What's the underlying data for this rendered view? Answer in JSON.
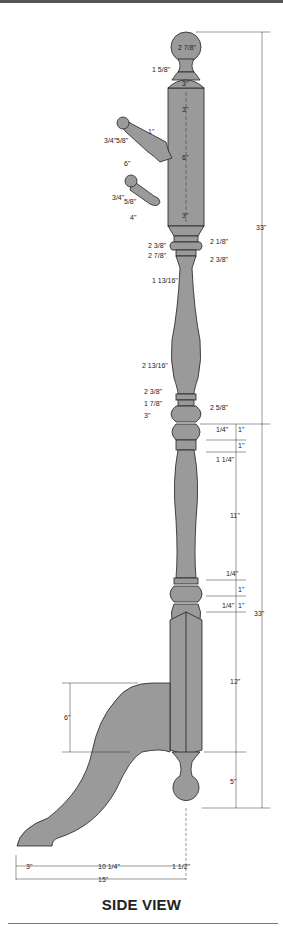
{
  "title": "SIDE VIEW",
  "colors": {
    "part_fill": "#9a9a9a",
    "line": "#222222",
    "background": "#ffffff"
  },
  "dimensions": {
    "finial_dia": "2 7/8\"",
    "neck_dia": "1 5/8\"",
    "post_top_width": "3\"",
    "top_seg_1": "3\"",
    "mid_seg": "6\"",
    "lower_seg": "3\"",
    "upper_total_height": "33\"",
    "lower_total_height": "33\"",
    "upper_peg": {
      "knob": "1\"",
      "w1": "3/4\"",
      "w2": "5/8\"",
      "length": "6\"",
      "base": "1\""
    },
    "lower_peg": {
      "knob": "1\"",
      "w1": "3/4\"",
      "w2": "5/8\"",
      "length": "4\""
    },
    "collar_left_1": "2 3/8\"",
    "collar_right_1": "2 1/8\"",
    "collar_left_2": "2 7/8\"",
    "collar_right_2": "2 3/8\"",
    "waist_dia": "1 13/16\"",
    "bulge_dia": "2 13/16\"",
    "lower_collar_left_1": "2 3/8\"",
    "lower_collar_left_2": "1 7/8\"",
    "lower_collar_right": "2 5/8\"",
    "lower_bead_dia": "3\"",
    "ring_heights_upper": [
      "1/4\"",
      "1\"",
      "1\"",
      "1 1/4\""
    ],
    "spindle_height": "11\"",
    "ring_heights_lower": [
      "1/4\"",
      "1\"",
      "1/4\"",
      "1\""
    ],
    "base_post_height": "12\"",
    "foot_ball_height": "5\"",
    "leg_rise": "6\"",
    "base_left": "3\"",
    "base_mid": "10 1/4\"",
    "base_right": "1 1/2\"",
    "base_total": "15\""
  }
}
